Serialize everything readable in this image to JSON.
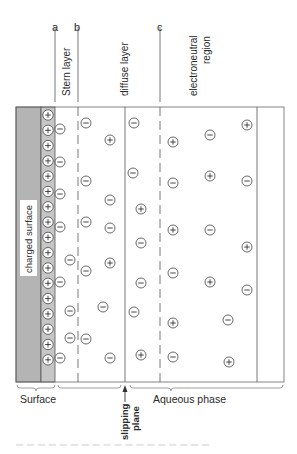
{
  "diagram": {
    "top_markers": [
      {
        "id": "a",
        "label": "a",
        "x": 55
      },
      {
        "id": "b",
        "label": "b",
        "x": 78
      },
      {
        "id": "c",
        "label": "c",
        "x": 160
      }
    ],
    "region_labels": {
      "stern": "Stern layer",
      "diffuse": "diffuse layer",
      "electroneutral_line1": "electroneutral",
      "electroneutral_line2": "region",
      "charged_surface": "charged surface"
    },
    "bottom_labels": {
      "surface": "Surface",
      "aqueous": "Aqueous phase",
      "slipping_line1": "slipping",
      "slipping_line2": "plane"
    },
    "colors": {
      "surface_fill": "#b4b4b4",
      "charged_layer_fill": "#c6c6c6",
      "line": "#555555",
      "ion": "#444444"
    },
    "surface_charges": {
      "sign": "+",
      "x": 48,
      "count": 17,
      "y_start": 115,
      "y_step": 15.3
    },
    "ions": [
      {
        "sign": "-",
        "x": 60,
        "y": 129
      },
      {
        "sign": "-",
        "x": 60,
        "y": 162
      },
      {
        "sign": "-",
        "x": 60,
        "y": 194
      },
      {
        "sign": "-",
        "x": 60,
        "y": 227
      },
      {
        "sign": "-",
        "x": 70,
        "y": 260
      },
      {
        "sign": "-",
        "x": 60,
        "y": 282
      },
      {
        "sign": "-",
        "x": 70,
        "y": 311
      },
      {
        "sign": "-",
        "x": 70,
        "y": 338
      },
      {
        "sign": "-",
        "x": 60,
        "y": 358
      },
      {
        "sign": "-",
        "x": 86,
        "y": 123
      },
      {
        "sign": "+",
        "x": 110,
        "y": 140
      },
      {
        "sign": "-",
        "x": 86,
        "y": 181
      },
      {
        "sign": "-",
        "x": 110,
        "y": 200
      },
      {
        "sign": "-",
        "x": 86,
        "y": 222
      },
      {
        "sign": "-",
        "x": 110,
        "y": 228
      },
      {
        "sign": "+",
        "x": 110,
        "y": 263
      },
      {
        "sign": "-",
        "x": 86,
        "y": 271
      },
      {
        "sign": "-",
        "x": 103,
        "y": 307
      },
      {
        "sign": "-",
        "x": 86,
        "y": 339
      },
      {
        "sign": "-",
        "x": 110,
        "y": 358
      },
      {
        "sign": "-",
        "x": 134,
        "y": 123
      },
      {
        "sign": "-",
        "x": 133,
        "y": 173
      },
      {
        "sign": "+",
        "x": 141,
        "y": 209
      },
      {
        "sign": "-",
        "x": 141,
        "y": 243
      },
      {
        "sign": "-",
        "x": 141,
        "y": 283
      },
      {
        "sign": "-",
        "x": 134,
        "y": 312
      },
      {
        "sign": "+",
        "x": 141,
        "y": 355
      },
      {
        "sign": "+",
        "x": 173,
        "y": 142
      },
      {
        "sign": "-",
        "x": 210,
        "y": 135
      },
      {
        "sign": "+",
        "x": 247,
        "y": 125
      },
      {
        "sign": "-",
        "x": 173,
        "y": 183
      },
      {
        "sign": "+",
        "x": 210,
        "y": 176
      },
      {
        "sign": "-",
        "x": 247,
        "y": 181
      },
      {
        "sign": "+",
        "x": 173,
        "y": 230
      },
      {
        "sign": "-",
        "x": 210,
        "y": 230
      },
      {
        "sign": "+",
        "x": 247,
        "y": 247
      },
      {
        "sign": "-",
        "x": 173,
        "y": 273
      },
      {
        "sign": "+",
        "x": 210,
        "y": 282
      },
      {
        "sign": "-",
        "x": 247,
        "y": 290
      },
      {
        "sign": "+",
        "x": 173,
        "y": 323
      },
      {
        "sign": "-",
        "x": 228,
        "y": 320
      },
      {
        "sign": "-",
        "x": 173,
        "y": 357
      },
      {
        "sign": "+",
        "x": 229,
        "y": 362
      }
    ]
  }
}
